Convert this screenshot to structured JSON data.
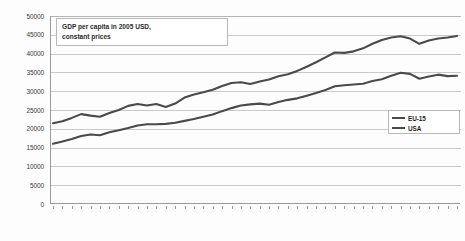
{
  "chart_data": {
    "type": "line",
    "title": "GDP per capita in 2005 USD, constant prices",
    "title_lines": [
      "GDP per capita in 2005 USD,",
      "constant prices"
    ],
    "xlabel": "",
    "ylabel": "",
    "ylim": [
      0,
      50000
    ],
    "ytick_step": 5000,
    "yticks": [
      "50000",
      "45000",
      "40000",
      "35000",
      "30000",
      "25000",
      "20000",
      "15000",
      "10000",
      "5000",
      "0"
    ],
    "grid": true,
    "legend_position": "bottom-right",
    "series_color": "#4a4a4a",
    "x": [
      1970,
      1971,
      1972,
      1973,
      1974,
      1975,
      1976,
      1977,
      1978,
      1979,
      1980,
      1981,
      1982,
      1983,
      1984,
      1985,
      1986,
      1987,
      1988,
      1989,
      1990,
      1991,
      1992,
      1993,
      1994,
      1995,
      1996,
      1997,
      1998,
      1999,
      2000,
      2001,
      2002,
      2003,
      2004,
      2005,
      2006,
      2007,
      2008,
      2009,
      2010,
      2011,
      2012,
      2013
    ],
    "categories": [
      "1970",
      "1971",
      "1972",
      "1973",
      "1974",
      "1975",
      "1976",
      "1977",
      "1978",
      "1979",
      "1980",
      "1981",
      "1982",
      "1983",
      "1984",
      "1985",
      "1986",
      "1987",
      "1988",
      "1989",
      "1990",
      "1991",
      "1992",
      "1993",
      "1994",
      "1995",
      "1996",
      "1997",
      "1998",
      "1999",
      "2000",
      "2001",
      "2002",
      "2003",
      "2004",
      "2005",
      "2006",
      "2007",
      "2008",
      "2009",
      "2010",
      "2011",
      "2012",
      "2013"
    ],
    "series": [
      {
        "name": "USA",
        "values": [
          21500,
          22000,
          22900,
          23900,
          23500,
          23200,
          24200,
          25000,
          26100,
          26600,
          26200,
          26600,
          25800,
          26700,
          28300,
          29100,
          29700,
          30400,
          31400,
          32200,
          32400,
          31900,
          32600,
          33100,
          34000,
          34500,
          35400,
          36500,
          37700,
          39000,
          40300,
          40200,
          40600,
          41400,
          42600,
          43600,
          44300,
          44600,
          44000,
          42600,
          43500,
          44000,
          44300,
          44700
        ]
      },
      {
        "name": "EU-15",
        "values": [
          16000,
          16600,
          17300,
          18100,
          18500,
          18300,
          19100,
          19600,
          20200,
          20900,
          21200,
          21200,
          21300,
          21600,
          22100,
          22600,
          23200,
          23800,
          24700,
          25500,
          26200,
          26500,
          26700,
          26400,
          27100,
          27700,
          28100,
          28800,
          29500,
          30300,
          31300,
          31600,
          31800,
          32000,
          32700,
          33200,
          34100,
          34900,
          34600,
          33300,
          33900,
          34400,
          34000,
          34100
        ]
      }
    ],
    "annotations": []
  },
  "legend": {
    "items": [
      {
        "label": "EU-15"
      },
      {
        "label": "USA"
      }
    ]
  }
}
